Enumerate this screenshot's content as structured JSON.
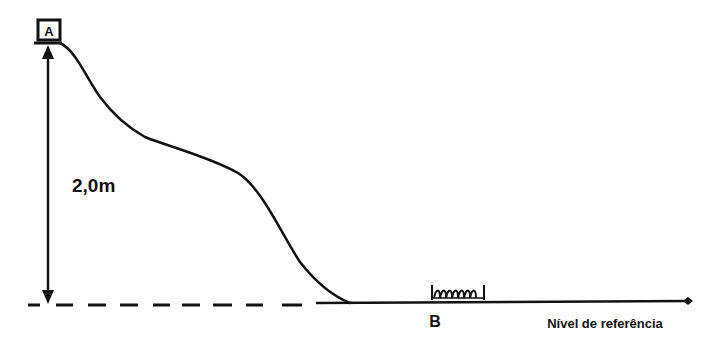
{
  "diagram": {
    "type": "physics-track-profile",
    "point_a_label": "A",
    "point_b_label": "B",
    "height_label": "2,0m",
    "reference_label": "Nível de referência",
    "objects": {
      "block_at_A": "box",
      "spring_at_B": "spring"
    },
    "colors": {
      "stroke": "#111111",
      "background": "#ffffff"
    }
  }
}
